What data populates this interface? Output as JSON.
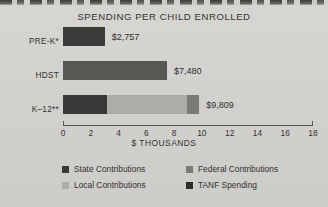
{
  "chart_data": {
    "type": "bar",
    "orientation": "horizontal",
    "stacked": true,
    "title": "SPENDING PER CHILD ENROLLED",
    "xlabel": "$ THOUSANDS",
    "ylabel": "",
    "xlim": [
      0,
      18
    ],
    "xticks": [
      "0",
      "2",
      "4",
      "6",
      "8",
      "10",
      "12",
      "14",
      "16",
      "18"
    ],
    "xtick_values": [
      0,
      2,
      4,
      6,
      8,
      10,
      12,
      14,
      16,
      18
    ],
    "grid": false,
    "legend_position": "bottom",
    "categories": [
      "PRE-K*",
      "HDST",
      "K–12**"
    ],
    "series": [
      {
        "name": "State Contributions",
        "key": "state",
        "color": "#3a3937",
        "values": [
          0,
          0,
          3.2
        ]
      },
      {
        "name": "Local Contributions",
        "key": "local",
        "color": "#aeaca8",
        "values": [
          0,
          0,
          5.7
        ]
      },
      {
        "name": "Federal Contributions",
        "key": "federal",
        "color": "#7c7a77",
        "values": [
          0,
          7.48,
          0.91
        ]
      },
      {
        "name": "TANF Spending",
        "key": "tanf",
        "color": "#3a3937",
        "values": [
          3.0,
          0,
          0
        ]
      }
    ],
    "bars": [
      {
        "category": "PRE-K*",
        "total": 3.0,
        "value_label": "$2,757",
        "segments": [
          {
            "key": "prek",
            "name": "TANF Spending",
            "value": 3.0,
            "color": "#3d3b39"
          }
        ]
      },
      {
        "category": "HDST",
        "total": 7.48,
        "value_label": "$7,480",
        "segments": [
          {
            "key": "hdst",
            "name": "Federal Contributions",
            "value": 7.48,
            "color": "#595754"
          }
        ]
      },
      {
        "category": "K–12**",
        "total": 9.81,
        "value_label": "$9,809",
        "segments": [
          {
            "key": "state",
            "name": "State Contributions",
            "value": 3.2,
            "color": "#3a3937"
          },
          {
            "key": "local",
            "name": "Local Contributions",
            "value": 5.7,
            "color": "#aeaca8"
          },
          {
            "key": "federal",
            "name": "Federal Contributions",
            "value": 0.91,
            "color": "#7c7a77"
          }
        ]
      }
    ],
    "totals_labels": [
      "$2,757",
      "$7,480",
      "$9,809"
    ],
    "legend": [
      {
        "label": "State Contributions",
        "key": "state",
        "color": "#3a3937"
      },
      {
        "label": "Federal Contributions",
        "key": "federal",
        "color": "#7c7a77"
      },
      {
        "label": "Local Contributions",
        "key": "local",
        "color": "#aeaca8"
      },
      {
        "label": "TANF Spending",
        "key": "tanf",
        "color": "#2f2e2c"
      }
    ]
  },
  "page": {
    "background_color": "#d5d4d1",
    "text_color": "#33312f"
  }
}
